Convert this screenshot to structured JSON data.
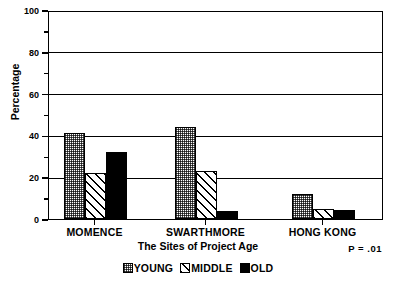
{
  "chart_data": {
    "type": "bar",
    "title": "",
    "xlabel": "The Sites of Project Age",
    "ylabel": "Percentage",
    "ylim": [
      0,
      100
    ],
    "ytick_values": [
      0,
      20,
      40,
      60,
      80,
      100
    ],
    "ytick_labels": [
      "0",
      "20",
      "40",
      "60",
      "80",
      "100"
    ],
    "yminor_ticks": [
      10,
      30,
      50,
      70,
      90
    ],
    "grid": true,
    "grid_axis": "y",
    "legend_position": "bottom-center",
    "categories": [
      "MOMENCE",
      "SWARTHMORE",
      "HONG KONG"
    ],
    "series": [
      {
        "name": "YOUNG",
        "pattern": "stipple-checker",
        "color": "#c9c9c9",
        "values": [
          41,
          44,
          12
        ]
      },
      {
        "name": "MIDDLE",
        "pattern": "diagonal-hatch",
        "color": "#ffffff",
        "values": [
          22,
          23,
          5
        ]
      },
      {
        "name": "OLD",
        "pattern": "solid",
        "color": "#000000",
        "values": [
          32,
          4,
          4.5
        ]
      }
    ],
    "annotations": [
      {
        "name": "p-value",
        "text": "P = .01"
      }
    ]
  },
  "axis": {
    "y_title": "Percentage",
    "x_title": "The Sites of Project Age"
  },
  "legend": {
    "items": [
      {
        "label": "YOUNG"
      },
      {
        "label": "MIDDLE"
      },
      {
        "label": "OLD"
      }
    ]
  },
  "note": {
    "p_value": "P = .01"
  }
}
